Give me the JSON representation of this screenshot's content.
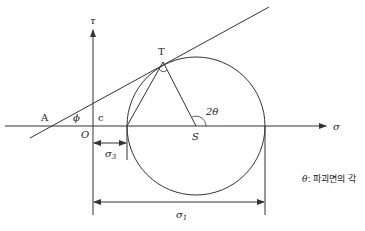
{
  "diagram": {
    "axes": {
      "x_label": "σ",
      "y_label": "τ",
      "origin_label": "O"
    },
    "points": {
      "A": "A",
      "T": "T",
      "S": "S",
      "c": "c"
    },
    "angles": {
      "phi": "ϕ",
      "two_theta": "2θ"
    },
    "dimensions": {
      "sigma3": "σ",
      "sigma3_sub": "3",
      "sigma1": "σ",
      "sigma1_sub": "1"
    },
    "note": {
      "symbol": "θ",
      "text": ": 파괴면의 각"
    },
    "colors": {
      "line": "#333333",
      "text": "#222222"
    }
  }
}
